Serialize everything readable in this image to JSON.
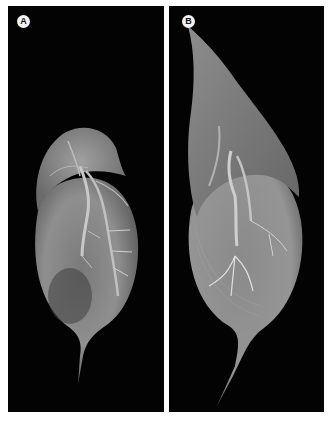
{
  "figure": {
    "panels": [
      {
        "id": "A",
        "label": "A",
        "subject": "scanning electron micrograph of seed with short apical wing"
      },
      {
        "id": "B",
        "label": "B",
        "subject": "scanning electron micrograph of seed with long pointed apical wing"
      }
    ],
    "colors": {
      "background": "#030303",
      "specimen": "#8a8a8a",
      "highlight": "#d8d8d8",
      "border": "#ffffff"
    }
  }
}
